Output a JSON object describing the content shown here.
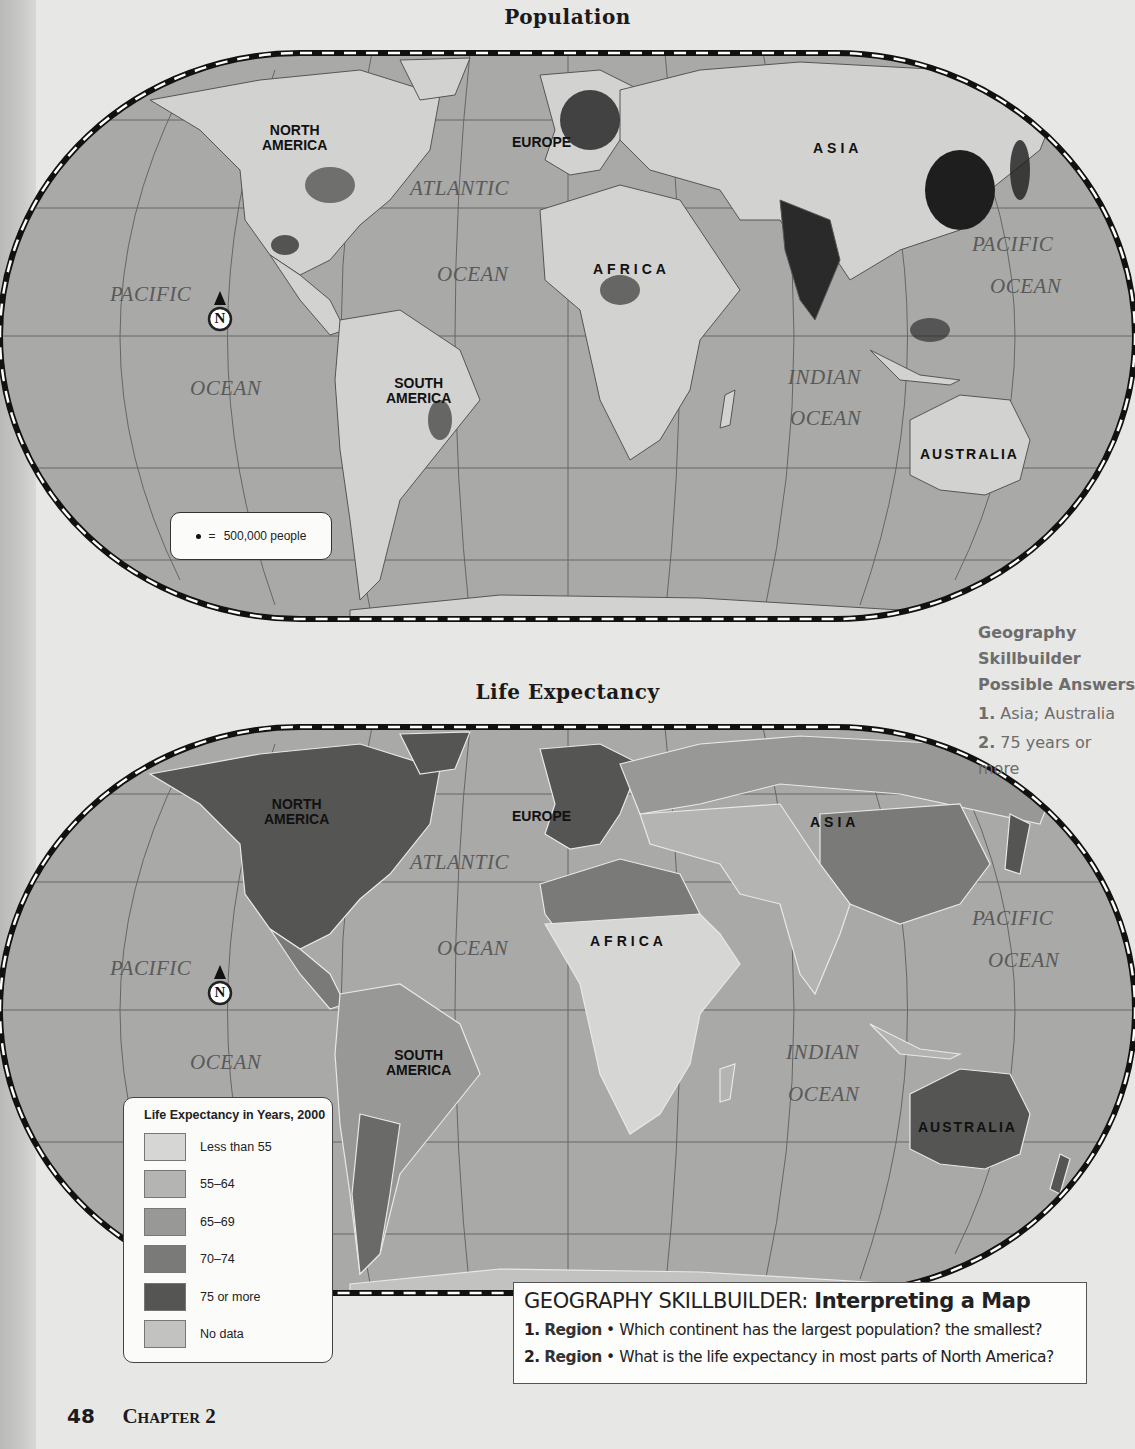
{
  "page": {
    "page_number": "48",
    "chapter": "Chapter 2"
  },
  "population_map": {
    "title": "Population",
    "continents": {
      "north_america": "NORTH\nAMERICA",
      "south_america": "SOUTH\nAMERICA",
      "europe": "EUROPE",
      "africa": "AFRICA",
      "asia": "ASIA",
      "australia": "AUSTRALIA"
    },
    "oceans": {
      "atlantic_1": "ATLANTIC",
      "atlantic_2": "OCEAN",
      "pacific_w_1": "PACIFIC",
      "pacific_w_2": "OCEAN",
      "pacific_e_1": "PACIFIC",
      "pacific_e_2": "OCEAN",
      "indian_1": "INDIAN",
      "indian_2": "OCEAN"
    },
    "compass": "N",
    "key": {
      "symbol": "•",
      "equals": "=",
      "text": "500,000 people"
    }
  },
  "life_expectancy_map": {
    "title": "Life Expectancy",
    "continents": {
      "north_america": "NORTH\nAMERICA",
      "south_america": "SOUTH\nAMERICA",
      "europe": "EUROPE",
      "africa": "AFRICA",
      "asia": "ASIA",
      "australia": "AUSTRALIA"
    },
    "oceans": {
      "atlantic_1": "ATLANTIC",
      "atlantic_2": "OCEAN",
      "pacific_w_1": "PACIFIC",
      "pacific_w_2": "OCEAN",
      "pacific_e_1": "PACIFIC",
      "pacific_e_2": "OCEAN",
      "indian_1": "INDIAN",
      "indian_2": "OCEAN"
    },
    "compass": "N",
    "legend": {
      "title": "Life Expectancy in Years, 2000",
      "items": [
        {
          "label": "Less than 55",
          "color": "#d6d6d4"
        },
        {
          "label": "55–64",
          "color": "#b4b4b2"
        },
        {
          "label": "65–69",
          "color": "#989896"
        },
        {
          "label": "70–74",
          "color": "#7a7a78"
        },
        {
          "label": "75 or more",
          "color": "#555553"
        },
        {
          "label": "No data",
          "color": "#c2c2c0"
        }
      ]
    }
  },
  "side_note": {
    "heading_1": "Geography",
    "heading_2": "Skillbuilder",
    "heading_3": "Possible Answers",
    "answers": [
      {
        "num": "1.",
        "text": "Asia; Australia"
      },
      {
        "num": "2.",
        "text": "75 years or more"
      }
    ]
  },
  "skillbuilder": {
    "title": "GEOGRAPHY SKILLBUILDER:",
    "subtitle": "Interpreting a Map",
    "questions": [
      {
        "num": "1.",
        "kind": "Region",
        "bullet": "•",
        "text": "Which continent has the largest population? the smallest?"
      },
      {
        "num": "2.",
        "kind": "Region",
        "bullet": "•",
        "text": "What is the life expectancy in most parts of North America?"
      }
    ]
  },
  "colors": {
    "ocean": "#a9a9a7",
    "land_light": "#d2d2d0",
    "page_bg": "#e7e7e5",
    "side_note_text": "#6d6d6d"
  }
}
